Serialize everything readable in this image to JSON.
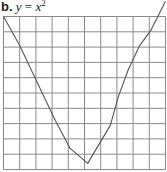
{
  "label": {
    "letter": "b.",
    "equation_lhs": "y",
    "equals": "=",
    "equation_rhs": "x",
    "exponent": "2"
  },
  "chart_data": {
    "type": "line",
    "grid": {
      "columns": 10,
      "rows": 10,
      "on": true
    },
    "xlabel": "",
    "ylabel": "",
    "points_grid_units": [
      {
        "x": 0,
        "y": 10
      },
      {
        "x": 1,
        "y": 8.1
      },
      {
        "x": 2.3,
        "y": 5.2
      },
      {
        "x": 3.2,
        "y": 3.2
      },
      {
        "x": 4.1,
        "y": 1.4
      },
      {
        "x": 5.2,
        "y": 0.4
      },
      {
        "x": 6.6,
        "y": 2.9
      },
      {
        "x": 7.1,
        "y": 4.8
      },
      {
        "x": 7.7,
        "y": 6.5
      },
      {
        "x": 8.4,
        "y": 8.1
      },
      {
        "x": 9.1,
        "y": 9.1
      },
      {
        "x": 10,
        "y": 11
      }
    ]
  },
  "style": {
    "grid_color": "#8a8a8a",
    "curve_color": "#555555",
    "text_color": "#222222"
  }
}
